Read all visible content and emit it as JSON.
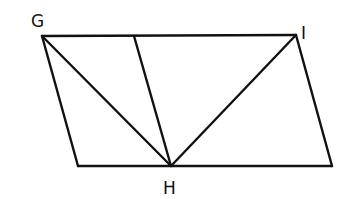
{
  "diagram": {
    "type": "geometry-figure",
    "style": "hand-drawn",
    "stroke_color": "#111111",
    "background": "#ffffff",
    "points": {
      "G": {
        "label": "G",
        "x": 42,
        "y": 36,
        "label_x": 31,
        "label_y": 27
      },
      "I": {
        "label": "I",
        "x": 296,
        "y": 35,
        "label_x": 301,
        "label_y": 39
      },
      "H": {
        "label": "H",
        "x": 171,
        "y": 166,
        "label_x": 163,
        "label_y": 194
      },
      "BL": {
        "label": "",
        "x": 78,
        "y": 166
      },
      "BR": {
        "label": "",
        "x": 332,
        "y": 166
      },
      "T": {
        "label": "",
        "x": 134,
        "y": 36
      }
    },
    "segments": [
      {
        "name": "top-edge",
        "from": "G",
        "to": "I"
      },
      {
        "name": "left-edge",
        "from": "G",
        "to": "BL"
      },
      {
        "name": "bottom-edge",
        "from": "BL",
        "to": "BR"
      },
      {
        "name": "right-edge",
        "from": "I",
        "to": "BR"
      },
      {
        "name": "diagonal-g-h",
        "from": "G",
        "to": "H"
      },
      {
        "name": "segment-t-h",
        "from": "T",
        "to": "H"
      },
      {
        "name": "diagonal-i-h",
        "from": "I",
        "to": "H"
      }
    ]
  }
}
